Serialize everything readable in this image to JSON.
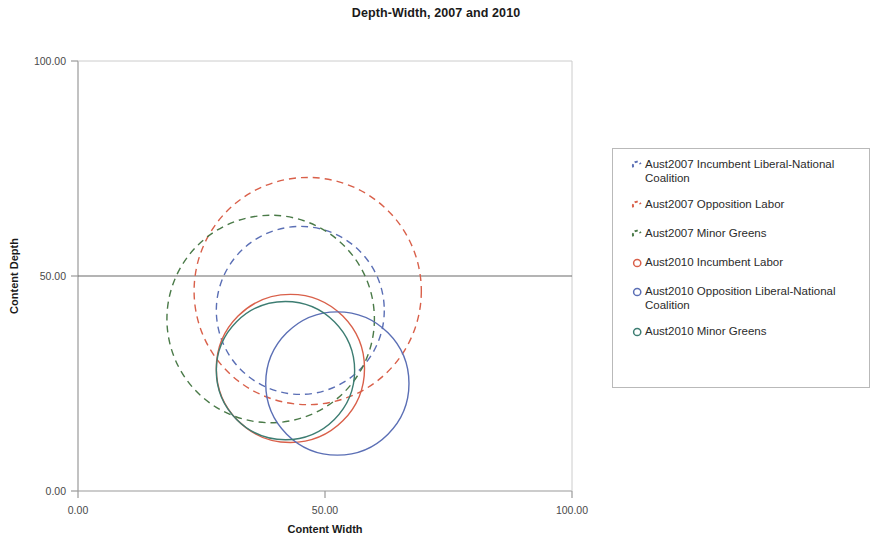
{
  "chart_data": {
    "type": "scatter",
    "title": "Depth-Width, 2007 and 2010",
    "xlabel": "Content Width",
    "ylabel": "Content Depth",
    "xlim": [
      0,
      100
    ],
    "ylim": [
      0,
      100
    ],
    "xticks": [
      "0.00",
      "50.00",
      "100.00"
    ],
    "xtick_values": [
      0,
      50,
      100
    ],
    "yticks": [
      "0.00",
      "50.00",
      "100.00"
    ],
    "ytick_values": [
      0,
      50,
      100
    ],
    "grid": false,
    "reference_line_y": 50,
    "legend_position": "right",
    "marker_shape": "circle-outline",
    "series": [
      {
        "name": "Aust2007 Incumbent Liberal-National Coalition",
        "short_name": "Aust2007 Incumbent Liberal-National\nCoalition",
        "color": "#5b6fb5",
        "linestyle": "dashed",
        "marker": "dashed-arc-icon",
        "x": 45.0,
        "y": 42.0,
        "radius": 17.0
      },
      {
        "name": "Aust2007 Opposition Labor",
        "short_name": "Aust2007 Opposition Labor",
        "color": "#d9604a",
        "linestyle": "dashed",
        "marker": "dashed-arc-icon",
        "x": 46.5,
        "y": 46.5,
        "radius": 23.0
      },
      {
        "name": "Aust2007 Minor Greens",
        "short_name": "Aust2007 Minor Greens",
        "color": "#4a7a48",
        "linestyle": "dashed",
        "marker": "dashed-arc-icon",
        "x": 39.0,
        "y": 40.0,
        "radius": 21.0
      },
      {
        "name": "Aust2010 Incumbent Labor",
        "short_name": "Aust2010 Incumbent Labor",
        "color": "#d9604a",
        "linestyle": "solid",
        "marker": "circle-outline-icon",
        "x": 43.0,
        "y": 28.5,
        "radius": 15.0
      },
      {
        "name": "Aust2010 Opposition Liberal-National Coalition",
        "short_name": "Aust2010 Opposition Liberal-National\nCoalition",
        "color": "#5b6fb5",
        "linestyle": "solid",
        "marker": "circle-outline-icon",
        "x": 52.5,
        "y": 25.0,
        "radius": 14.5
      },
      {
        "name": "Aust2010 Minor Greens",
        "short_name": "Aust2010 Minor Greens",
        "color": "#3d7d72",
        "linestyle": "solid",
        "marker": "circle-outline-icon",
        "x": 42.0,
        "y": 28.0,
        "radius": 14.0
      }
    ]
  }
}
